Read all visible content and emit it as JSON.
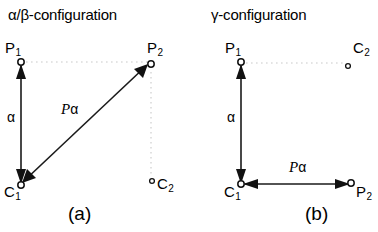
{
  "figure": {
    "panels": [
      {
        "id": "a",
        "title": "α/β-configuration",
        "caption": "(a)",
        "nodes": [
          {
            "name": "P1",
            "label": "P",
            "sub": "1"
          },
          {
            "name": "P2",
            "label": "P",
            "sub": "2"
          },
          {
            "name": "C1",
            "label": "C",
            "sub": "1"
          },
          {
            "name": "C2",
            "label": "C",
            "sub": "2"
          }
        ],
        "vectors": [
          {
            "name": "alpha",
            "label": "α",
            "from": "C1",
            "to": "P1",
            "style": "solid",
            "arrowheads": "both"
          },
          {
            "name": "P-alpha",
            "label_italic": "P",
            "label_upright": "α",
            "from": "P2",
            "to": "C1",
            "style": "solid",
            "arrowheads": "both"
          }
        ],
        "guides": [
          {
            "name": "guide-P1-P2",
            "style": "dotted"
          },
          {
            "name": "guide-P2-C2",
            "style": "dotted"
          }
        ]
      },
      {
        "id": "b",
        "title": "γ-configuration",
        "caption": "(b)",
        "nodes": [
          {
            "name": "P1",
            "label": "P",
            "sub": "1"
          },
          {
            "name": "C2",
            "label": "C",
            "sub": "2"
          },
          {
            "name": "C1",
            "label": "C",
            "sub": "1"
          },
          {
            "name": "P2",
            "label": "P",
            "sub": "2"
          }
        ],
        "vectors": [
          {
            "name": "alpha",
            "label": "α",
            "from": "C1",
            "to": "P1",
            "style": "solid",
            "arrowheads": "both"
          },
          {
            "name": "P-alpha",
            "label_italic": "P",
            "label_upright": "α",
            "from": "P2",
            "to": "C1",
            "style": "solid",
            "arrowheads": "both"
          }
        ],
        "guides": [
          {
            "name": "guide-P1-C2",
            "style": "dotted"
          }
        ]
      }
    ]
  },
  "colors": {
    "stroke": "#1a1a1a",
    "guide": "#c9c9c9",
    "background": "#ffffff"
  }
}
